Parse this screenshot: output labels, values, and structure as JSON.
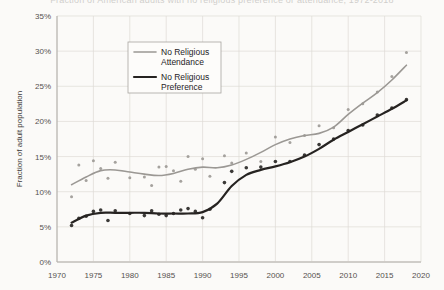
{
  "chart_data": {
    "type": "scatter",
    "title": "Fraction of American adults with no religious preference or attendance, 1972-2018",
    "xlabel": "",
    "ylabel": "Fraction of adult population",
    "xlim": [
      1970,
      2020
    ],
    "ylim": [
      0,
      35
    ],
    "xticks": [
      1970,
      1975,
      1980,
      1985,
      1990,
      1995,
      2000,
      2005,
      2010,
      2015,
      2020
    ],
    "xticklabels": [
      "1970",
      "1975",
      "1980",
      "1985",
      "1990",
      "1995",
      "2000",
      "2005",
      "2010",
      "2015",
      "2020"
    ],
    "yticks": [
      0,
      5,
      10,
      15,
      20,
      25,
      30,
      35
    ],
    "yticklabels": [
      "0%",
      "5%",
      "10%",
      "15%",
      "20%",
      "25%",
      "30%",
      "35%"
    ],
    "grid": true,
    "legend_position": "upper-left-inside",
    "series": [
      {
        "name": "No Religious Attendance",
        "color": "#9b9894",
        "line_width": 1.6,
        "marker_size": 1.5,
        "trend": {
          "x": [
            1972,
            1974,
            1976,
            1978,
            1980,
            1982,
            1984,
            1986,
            1988,
            1990,
            1992,
            1994,
            1996,
            1998,
            2000,
            2002,
            2004,
            2006,
            2008,
            2010,
            2012,
            2014,
            2016,
            2018
          ],
          "y": [
            11.0,
            12.1,
            13.0,
            13.1,
            12.8,
            12.5,
            12.3,
            12.6,
            13.2,
            13.5,
            13.4,
            13.8,
            14.6,
            15.6,
            16.7,
            17.5,
            18.0,
            18.3,
            19.2,
            21.0,
            22.6,
            24.1,
            25.9,
            28.0
          ],
          "ylabel_unit": "%"
        },
        "points": {
          "x": [
            1972,
            1973,
            1974,
            1975,
            1976,
            1977,
            1978,
            1980,
            1982,
            1983,
            1984,
            1985,
            1986,
            1987,
            1988,
            1989,
            1990,
            1991,
            1993,
            1994,
            1996,
            1998,
            2000,
            2002,
            2004,
            2006,
            2008,
            2010,
            2012,
            2014,
            2016,
            2018
          ],
          "y": [
            9.3,
            13.8,
            11.6,
            14.4,
            13.3,
            11.9,
            14.2,
            12.0,
            12.1,
            10.9,
            13.5,
            13.6,
            13.0,
            11.5,
            15.0,
            13.2,
            14.7,
            12.2,
            15.1,
            14.1,
            15.5,
            14.3,
            17.8,
            17.0,
            18.0,
            19.4,
            19.1,
            21.7,
            22.5,
            24.2,
            26.4,
            29.8
          ]
        }
      },
      {
        "name": "No Religious Preference",
        "color": "#262321",
        "line_width": 2.2,
        "marker_size": 1.8,
        "trend": {
          "x": [
            1972,
            1974,
            1976,
            1978,
            1980,
            1982,
            1984,
            1986,
            1988,
            1990,
            1992,
            1994,
            1996,
            1998,
            2000,
            2002,
            2004,
            2006,
            2008,
            2010,
            2012,
            2014,
            2016,
            2018
          ],
          "y": [
            5.6,
            6.6,
            7.0,
            7.0,
            7.0,
            7.0,
            6.9,
            6.9,
            6.9,
            7.1,
            8.3,
            10.8,
            12.4,
            13.1,
            13.6,
            14.2,
            15.0,
            16.1,
            17.4,
            18.5,
            19.6,
            20.7,
            21.8,
            23.0
          ],
          "ylabel_unit": "%"
        },
        "points": {
          "x": [
            1972,
            1973,
            1974,
            1975,
            1976,
            1977,
            1978,
            1980,
            1982,
            1983,
            1984,
            1985,
            1986,
            1987,
            1988,
            1989,
            1990,
            1991,
            1993,
            1994,
            1996,
            1998,
            2000,
            2002,
            2004,
            2006,
            2008,
            2010,
            2012,
            2014,
            2016,
            2018
          ],
          "y": [
            5.2,
            6.2,
            6.5,
            7.2,
            7.4,
            5.9,
            7.3,
            6.9,
            6.6,
            7.3,
            6.8,
            6.6,
            6.9,
            7.4,
            7.6,
            7.2,
            6.3,
            7.5,
            11.3,
            12.9,
            13.4,
            13.5,
            14.3,
            14.3,
            15.2,
            16.7,
            17.5,
            18.7,
            19.5,
            20.9,
            21.9,
            23.1
          ]
        }
      }
    ]
  },
  "legend": {
    "entries": [
      {
        "label_line1": "No Religious",
        "label_line2": "Attendance"
      },
      {
        "label_line1": "No Religious",
        "label_line2": "Preference"
      }
    ]
  }
}
